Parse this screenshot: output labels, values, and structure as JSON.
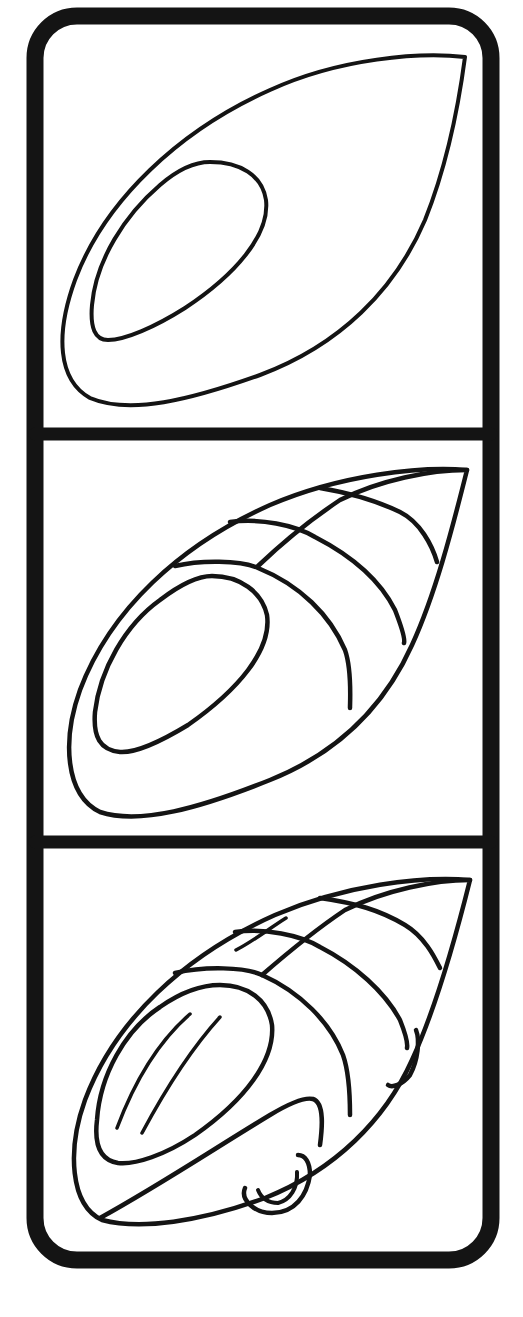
{
  "figure": {
    "type": "step-by-step drawing tutorial",
    "background": "#ffffff",
    "ink_color": "#141414",
    "panels": [
      {
        "step": 1,
        "description": "Teardrop body outline with inner oval cockpit"
      },
      {
        "step": 2,
        "description": "Body segmented with curved panel lines and cockpit rim"
      },
      {
        "step": 3,
        "description": "Cockpit windshield highlights, side fairing and wheels added"
      }
    ]
  }
}
